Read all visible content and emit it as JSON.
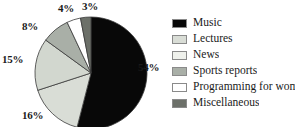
{
  "chart_data": {
    "type": "pie",
    "title": "",
    "subtitle": "",
    "xlabel": "",
    "ylabel": "",
    "grid": false,
    "legend_position": "right",
    "start_angle_deg": 0,
    "direction": "clockwise",
    "units": "percent",
    "categories": [
      "Music",
      "Lectures",
      "News",
      "Sports reports",
      "Programming for women",
      "Miscellaneous"
    ],
    "values": [
      54,
      16,
      15,
      8,
      4,
      3
    ],
    "data_labels": [
      "54%",
      "16%",
      "15%",
      "8%",
      "4%",
      "3%"
    ],
    "colors": [
      "#080808",
      "#d9ddd6",
      "#d2d7cf",
      "#a9afa7",
      "#ffffff",
      "#6c7069"
    ],
    "slices": [
      {
        "label": "Music",
        "value": 54,
        "data_label": "54%",
        "color": "#080808"
      },
      {
        "label": "Lectures",
        "value": 16,
        "data_label": "16%",
        "color": "#d9ddd6"
      },
      {
        "label": "News",
        "value": 15,
        "data_label": "15%",
        "color": "#d2d7cf"
      },
      {
        "label": "Sports reports",
        "value": 8,
        "data_label": "8%",
        "color": "#a9afa7"
      },
      {
        "label": "Programming for women",
        "value": 4,
        "data_label": "4%",
        "color": "#ffffff"
      },
      {
        "label": "Miscellaneous",
        "value": 3,
        "data_label": "3%",
        "color": "#6c7069"
      }
    ]
  },
  "legend": {
    "items": [
      {
        "label": "Music",
        "color": "#080808"
      },
      {
        "label": "Lectures",
        "color": "#d9ddd6"
      },
      {
        "label": "News",
        "color": "#eff1ec"
      },
      {
        "label": "Sports reports",
        "color": "#a9afa7"
      },
      {
        "label": "Programming for women",
        "color": "#ffffff"
      },
      {
        "label": "Miscellaneous",
        "color": "#6c7069"
      }
    ]
  },
  "style": {
    "slice_outline": "#3a3a3a",
    "swatch_border": "#8a8a8a",
    "text_color": "#1a1a1a",
    "background": "#ffffff"
  }
}
